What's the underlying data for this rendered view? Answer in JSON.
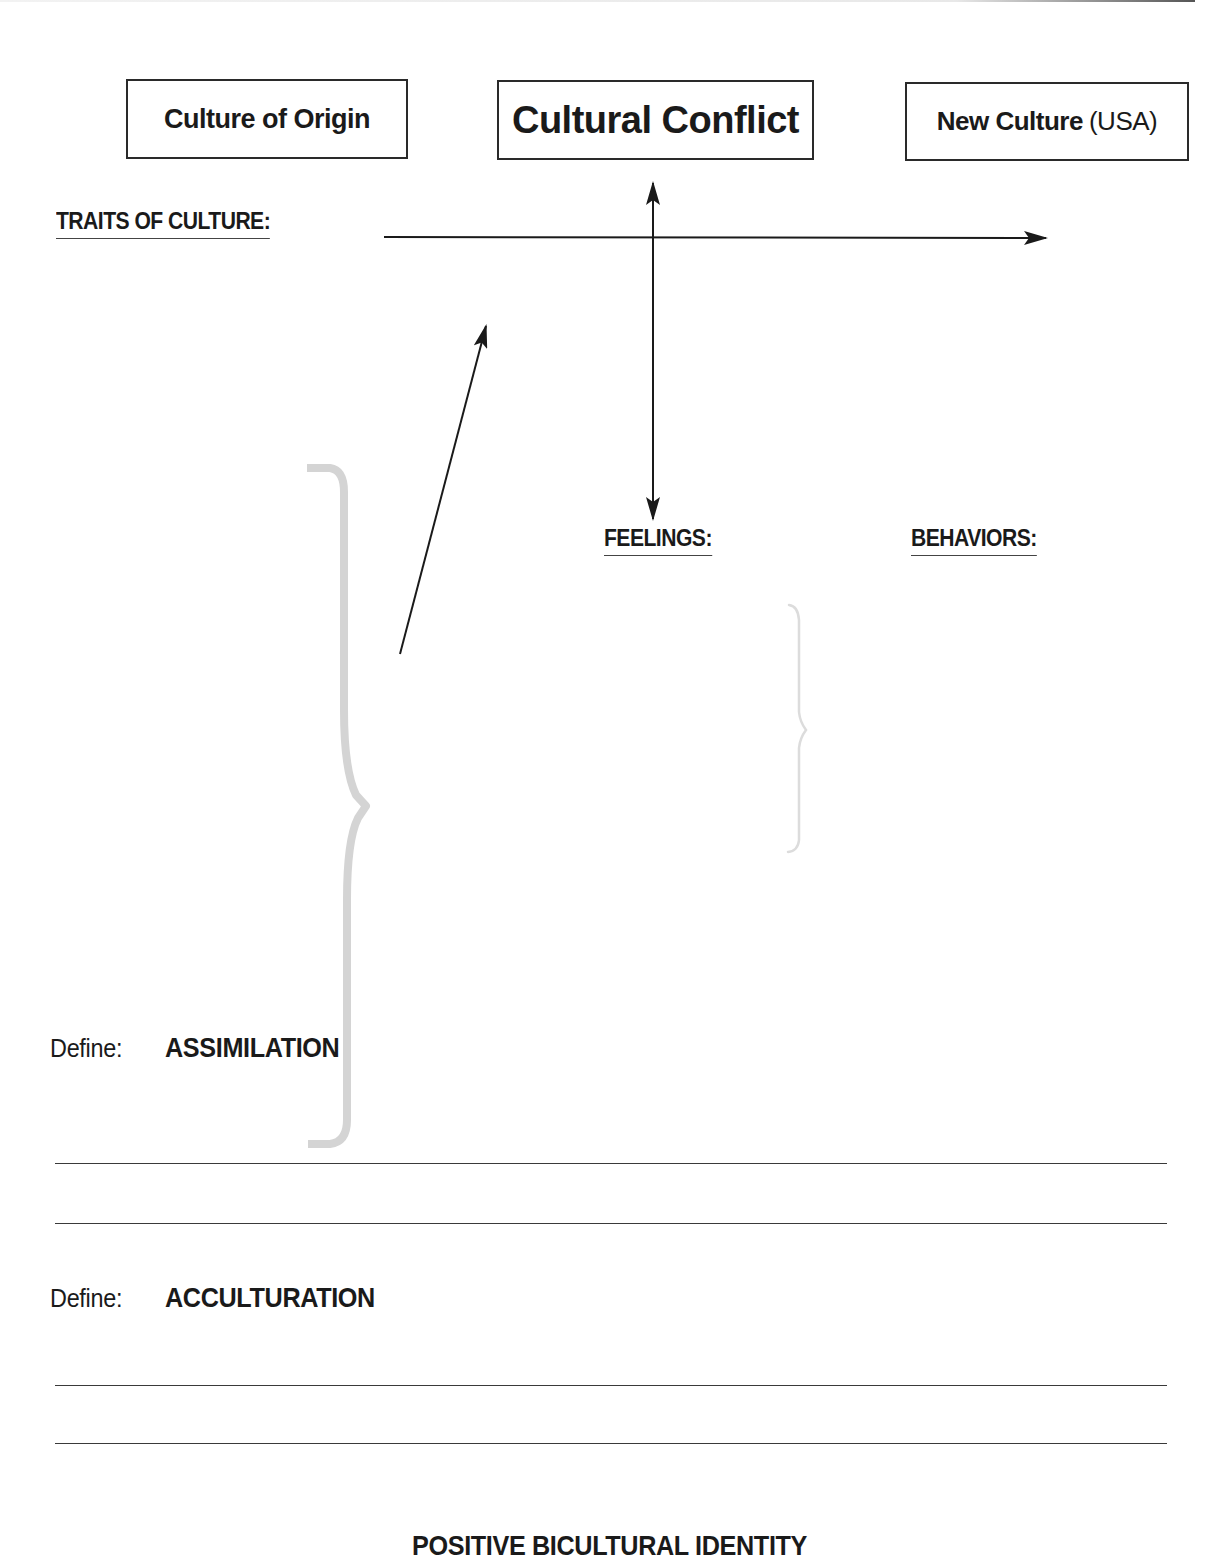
{
  "worksheet": {
    "boxes": {
      "origin": {
        "label": "Culture of Origin"
      },
      "conflict": {
        "label": "Cultural Conflict"
      },
      "new_culture": {
        "label_bold": "New Culture",
        "label_normal": "(USA)"
      }
    },
    "headings": {
      "traits": "TRAITS OF CULTURE:",
      "feelings": "FEELINGS:",
      "behaviors": "BEHAVIORS:"
    },
    "definitions": [
      {
        "prompt": "Define:",
        "term": "ASSIMILATION",
        "answer_lines": 2
      },
      {
        "prompt": "Define:",
        "term": "ACCULTURATION",
        "answer_lines": 2
      }
    ],
    "footer_heading": "POSITIVE BICULTURAL IDENTITY",
    "colors": {
      "ink": "#1a1a1a",
      "bracket_gray": "#d4d4d4",
      "bracket_light": "#e0e0e0"
    },
    "diagram_elements": {
      "horizontal_arrow": {
        "from": "TRAITS OF CULTURE",
        "to": "New Culture",
        "direction": "right"
      },
      "vertical_arrow": {
        "between": [
          "Cultural Conflict",
          "FEELINGS"
        ],
        "direction": "both"
      },
      "diagonal_arrow": {
        "direction": "up-right"
      },
      "left_brace": "large curly brace (gray)",
      "right_brace": "small curly brace (light gray)"
    }
  }
}
